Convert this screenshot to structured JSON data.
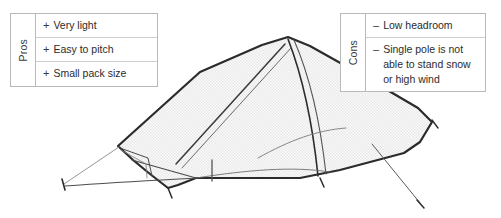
{
  "figure": {
    "background_color": "#ffffff",
    "outline_color": "#2b2b2b",
    "fabric_fill_color": "#f2f2f2",
    "fabric_pattern": "fine checkerboard dot texture",
    "guyline_color": "#3c3c3c",
    "table_border_color": "#b9b9b9",
    "text_color": "#2b2b2b"
  },
  "pros": {
    "label": "Pros",
    "marker": "+",
    "items": [
      {
        "marker": "+",
        "text": "Very light"
      },
      {
        "marker": "+",
        "text": "Easy to pitch"
      },
      {
        "marker": "+",
        "text": "Small pack size"
      }
    ]
  },
  "cons": {
    "label": "Cons",
    "marker": "–",
    "items": [
      {
        "marker": "–",
        "text": "Low headroom"
      },
      {
        "marker": "–",
        "text": "Single pole is not able to stand snow or high wind"
      }
    ]
  }
}
